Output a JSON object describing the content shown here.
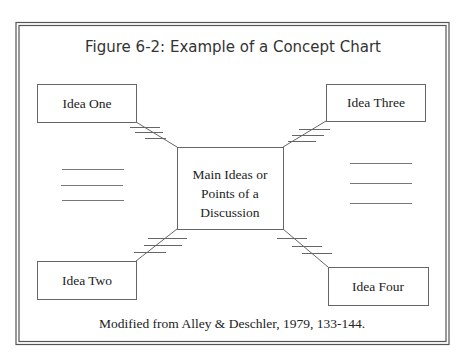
{
  "title": "Figure 6-2: Example of a Concept Chart",
  "center": {
    "lines": [
      "Main Ideas or",
      "Points of a",
      "Discussion"
    ]
  },
  "ideas": {
    "one": "Idea One",
    "two": "Idea Two",
    "three": "Idea Three",
    "four": "Idea Four"
  },
  "caption": "Modified from Alley & Deschler, 1979, 133-144.",
  "colors": {
    "line": "#666666",
    "text": "#222222",
    "background": "#ffffff"
  }
}
